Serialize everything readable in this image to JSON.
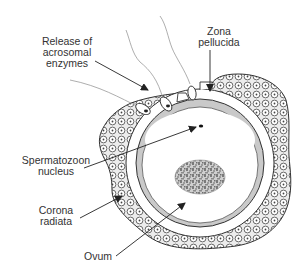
{
  "diagram": {
    "labels": {
      "acrosomal": [
        "Release of",
        "acrosomal",
        "enzymes"
      ],
      "zona": [
        "Zona",
        "pellucida"
      ],
      "sperm_nucleus": [
        "Spermatozoon",
        "nucleus"
      ],
      "corona": [
        "Corona",
        "radiata"
      ],
      "ovum": [
        "Ovum"
      ]
    },
    "colors": {
      "line": "#333333",
      "corona_fill": "#e9e9e9",
      "zona_grey": "#c8c8c8",
      "nucleus_texture": "#9a9a9a",
      "background": "#ffffff"
    }
  }
}
